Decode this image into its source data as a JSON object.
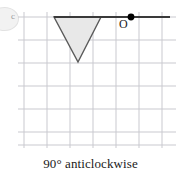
{
  "figure": {
    "caption": "90° anticlockwise",
    "origin_label": "O",
    "badge_label": "c",
    "colors": {
      "grid": "#c9c9cf",
      "shape_fill": "#e8e8e8",
      "shape_stroke": "#5a5a5a",
      "ray_stroke": "#3a3a3a",
      "point_fill": "#000000",
      "background": "#ffffff",
      "text": "#1a1a1a"
    },
    "grid": {
      "x_lines": [
        24,
        47,
        70,
        93,
        116,
        139,
        162
      ],
      "y_lines": [
        17,
        40,
        63,
        86,
        109,
        132,
        145
      ],
      "cell_size": 23,
      "visible": true
    },
    "shape": {
      "name": "triangle",
      "orientation": "pointing-down",
      "vertices": [
        [
          54,
          17
        ],
        [
          101,
          17
        ],
        [
          78,
          62
        ]
      ]
    },
    "ray": {
      "from": [
        54,
        17
      ],
      "to": [
        170,
        17
      ]
    },
    "centre_of_rotation": {
      "point": [
        131,
        17
      ],
      "label": "O",
      "radius": 3.4
    }
  }
}
